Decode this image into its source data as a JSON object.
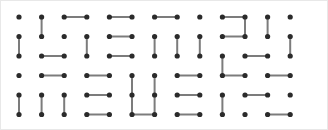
{
  "figure": {
    "name": "dimer-tiling-grid",
    "kind": "dot-grid-with-dimer-edges",
    "background_color": "#ffffff",
    "border_color": "#e8e8e8",
    "dot_color": "#2b2b2b",
    "edge_color": "#7c7c7c",
    "dot_radius": 2.6,
    "edge_width": 2,
    "width": 328,
    "height": 130
  },
  "chart_data": {
    "type": "scatter",
    "title": "",
    "subtitle": "",
    "xlabel": "",
    "ylabel": "",
    "grid": false,
    "legend": null,
    "rows": 6,
    "cols": 13,
    "origin_x": 18,
    "origin_y": 16,
    "step_x": 22.6,
    "step_y": 19.5,
    "xlim": [
      0,
      12
    ],
    "ylim": [
      0,
      5
    ],
    "x_ticks": [
      0,
      1,
      2,
      3,
      4,
      5,
      6,
      7,
      8,
      9,
      10,
      11,
      12
    ],
    "y_ticks": [
      0,
      1,
      2,
      3,
      4,
      5
    ],
    "dots": [
      [
        0,
        0
      ],
      [
        0,
        1
      ],
      [
        0,
        2
      ],
      [
        0,
        3
      ],
      [
        0,
        4
      ],
      [
        0,
        5
      ],
      [
        0,
        6
      ],
      [
        0,
        7
      ],
      [
        0,
        8
      ],
      [
        0,
        9
      ],
      [
        0,
        10
      ],
      [
        0,
        11
      ],
      [
        0,
        12
      ],
      [
        1,
        0
      ],
      [
        1,
        1
      ],
      [
        1,
        2
      ],
      [
        1,
        3
      ],
      [
        1,
        4
      ],
      [
        1,
        5
      ],
      [
        1,
        6
      ],
      [
        1,
        7
      ],
      [
        1,
        8
      ],
      [
        1,
        9
      ],
      [
        1,
        10
      ],
      [
        1,
        11
      ],
      [
        1,
        12
      ],
      [
        2,
        0
      ],
      [
        2,
        1
      ],
      [
        2,
        2
      ],
      [
        2,
        3
      ],
      [
        2,
        4
      ],
      [
        2,
        5
      ],
      [
        2,
        6
      ],
      [
        2,
        7
      ],
      [
        2,
        8
      ],
      [
        2,
        9
      ],
      [
        2,
        10
      ],
      [
        2,
        11
      ],
      [
        2,
        12
      ],
      [
        3,
        0
      ],
      [
        3,
        1
      ],
      [
        3,
        2
      ],
      [
        3,
        3
      ],
      [
        3,
        4
      ],
      [
        3,
        5
      ],
      [
        3,
        6
      ],
      [
        3,
        7
      ],
      [
        3,
        8
      ],
      [
        3,
        9
      ],
      [
        3,
        10
      ],
      [
        3,
        11
      ],
      [
        3,
        12
      ],
      [
        4,
        0
      ],
      [
        4,
        1
      ],
      [
        4,
        2
      ],
      [
        4,
        3
      ],
      [
        4,
        4
      ],
      [
        4,
        5
      ],
      [
        4,
        6
      ],
      [
        4,
        7
      ],
      [
        4,
        8
      ],
      [
        4,
        9
      ],
      [
        4,
        10
      ],
      [
        4,
        11
      ],
      [
        4,
        12
      ],
      [
        5,
        0
      ],
      [
        5,
        1
      ],
      [
        5,
        2
      ],
      [
        5,
        3
      ],
      [
        5,
        4
      ],
      [
        5,
        5
      ],
      [
        5,
        6
      ],
      [
        5,
        7
      ],
      [
        5,
        8
      ],
      [
        5,
        9
      ],
      [
        5,
        10
      ],
      [
        5,
        11
      ],
      [
        5,
        12
      ]
    ],
    "edges": [
      {
        "orientation": "vertical",
        "row": 0,
        "col": 1
      },
      {
        "orientation": "horizontal",
        "row": 0,
        "col": 2
      },
      {
        "orientation": "horizontal",
        "row": 0,
        "col": 4
      },
      {
        "orientation": "horizontal",
        "row": 0,
        "col": 6
      },
      {
        "orientation": "horizontal",
        "row": 0,
        "col": 9
      },
      {
        "orientation": "vertical",
        "row": 0,
        "col": 10
      },
      {
        "orientation": "vertical",
        "row": 0,
        "col": 11
      },
      {
        "orientation": "vertical",
        "row": 1,
        "col": 0
      },
      {
        "orientation": "vertical",
        "row": 1,
        "col": 3
      },
      {
        "orientation": "horizontal",
        "row": 1,
        "col": 4
      },
      {
        "orientation": "vertical",
        "row": 1,
        "col": 6
      },
      {
        "orientation": "vertical",
        "row": 1,
        "col": 7
      },
      {
        "orientation": "vertical",
        "row": 1,
        "col": 8
      },
      {
        "orientation": "horizontal",
        "row": 1,
        "col": 9
      },
      {
        "orientation": "vertical",
        "row": 1,
        "col": 12
      },
      {
        "orientation": "horizontal",
        "row": 2,
        "col": 1
      },
      {
        "orientation": "horizontal",
        "row": 2,
        "col": 4
      },
      {
        "orientation": "horizontal",
        "row": 2,
        "col": 10
      },
      {
        "orientation": "vertical",
        "row": 2,
        "col": 9
      },
      {
        "orientation": "horizontal",
        "row": 3,
        "col": 1
      },
      {
        "orientation": "horizontal",
        "row": 3,
        "col": 3
      },
      {
        "orientation": "horizontal",
        "row": 3,
        "col": 7
      },
      {
        "orientation": "horizontal",
        "row": 3,
        "col": 9
      },
      {
        "orientation": "vertical",
        "row": 3,
        "col": 5
      },
      {
        "orientation": "vertical",
        "row": 3,
        "col": 6
      },
      {
        "orientation": "horizontal",
        "row": 3,
        "col": 11
      },
      {
        "orientation": "vertical",
        "row": 4,
        "col": 0
      },
      {
        "orientation": "vertical",
        "row": 4,
        "col": 1
      },
      {
        "orientation": "vertical",
        "row": 4,
        "col": 2
      },
      {
        "orientation": "horizontal",
        "row": 4,
        "col": 3
      },
      {
        "orientation": "vertical",
        "row": 4,
        "col": 5
      },
      {
        "orientation": "vertical",
        "row": 4,
        "col": 6
      },
      {
        "orientation": "horizontal",
        "row": 4,
        "col": 7
      },
      {
        "orientation": "vertical",
        "row": 4,
        "col": 9
      },
      {
        "orientation": "horizontal",
        "row": 4,
        "col": 10
      },
      {
        "orientation": "horizontal",
        "row": 5,
        "col": 3
      },
      {
        "orientation": "horizontal",
        "row": 5,
        "col": 5
      },
      {
        "orientation": "horizontal",
        "row": 5,
        "col": 7
      },
      {
        "orientation": "horizontal",
        "row": 5,
        "col": 11
      }
    ]
  }
}
